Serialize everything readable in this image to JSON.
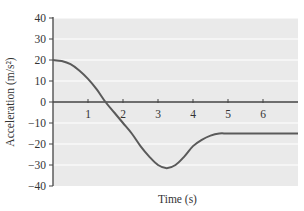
{
  "chart_data": {
    "type": "line",
    "title": "",
    "xlabel": "Time (s)",
    "ylabel": "Acceleration (m/s²)",
    "xlim": [
      0,
      7
    ],
    "ylim": [
      -40,
      40
    ],
    "x_ticks": [
      1,
      2,
      3,
      4,
      5,
      6
    ],
    "x_tick_labels": [
      "1",
      "2",
      "3",
      "4",
      "5",
      "6"
    ],
    "y_ticks": [
      40,
      30,
      20,
      10,
      0,
      -10,
      -20,
      -30,
      -40
    ],
    "y_tick_labels": [
      "40",
      "30",
      "20",
      "10",
      "0",
      "−10",
      "−20",
      "−30",
      "−40"
    ],
    "grid": true,
    "grid_style": "horizontal white lines at every 10 m/s²",
    "legend": null,
    "series": [
      {
        "name": "Acceleration",
        "x": [
          0,
          0.25,
          0.5,
          0.75,
          1.0,
          1.25,
          1.5,
          1.75,
          2.0,
          2.25,
          2.5,
          2.75,
          3.0,
          3.25,
          3.5,
          3.75,
          4.0,
          4.25,
          4.5,
          4.75,
          5.0,
          5.5,
          6.0,
          6.5,
          7.0
        ],
        "values": [
          20,
          19.5,
          18,
          15,
          11,
          6,
          0,
          -5,
          -10,
          -15,
          -21,
          -26,
          -30,
          -31.5,
          -30,
          -26,
          -21,
          -18,
          -16,
          -15,
          -15,
          -15,
          -15,
          -15,
          -15
        ]
      }
    ],
    "colors": {
      "line": "#5a5a5a",
      "plot_background": "#eaeaea",
      "grid": "#ffffff",
      "axis": "#444444"
    }
  }
}
